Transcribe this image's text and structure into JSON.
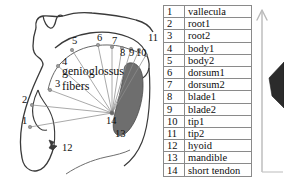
{
  "figure": {
    "title": "",
    "diagram_labels": {
      "fiber_text_line1": "genioglossus",
      "fiber_text_line2": "fibers"
    },
    "diagram_numbers": [
      {
        "id": "1",
        "x": 22,
        "y": 120
      },
      {
        "id": "2",
        "x": 22,
        "y": 100
      },
      {
        "id": "3",
        "x": 57,
        "y": 84
      },
      {
        "id": "4",
        "x": 62,
        "y": 63
      },
      {
        "id": "5",
        "x": 74,
        "y": 45
      },
      {
        "id": "6",
        "x": 100,
        "y": 42
      },
      {
        "id": "7",
        "x": 114,
        "y": 45
      },
      {
        "id": "8",
        "x": 123,
        "y": 54
      },
      {
        "id": "9",
        "x": 132,
        "y": 53
      },
      {
        "id": "10",
        "x": 139,
        "y": 53
      },
      {
        "id": "11",
        "x": 150,
        "y": 40
      },
      {
        "id": "12",
        "x": 63,
        "y": 148
      },
      {
        "id": "13",
        "x": 118,
        "y": 134
      },
      {
        "id": "14",
        "x": 110,
        "y": 119
      }
    ]
  },
  "legend": {
    "columns": [
      "index",
      "name"
    ],
    "rows": [
      {
        "index": "1",
        "name": "vallecula"
      },
      {
        "index": "2",
        "name": "root1"
      },
      {
        "index": "3",
        "name": "root2"
      },
      {
        "index": "4",
        "name": "body1"
      },
      {
        "index": "5",
        "name": "body2"
      },
      {
        "index": "6",
        "name": "dorsum1"
      },
      {
        "index": "7",
        "name": "dorsum2"
      },
      {
        "index": "8",
        "name": "blade1"
      },
      {
        "index": "9",
        "name": "blade2"
      },
      {
        "index": "10",
        "name": "tip1"
      },
      {
        "index": "11",
        "name": "tip2"
      },
      {
        "index": "12",
        "name": "hyoid"
      },
      {
        "index": "13",
        "name": "mandible"
      },
      {
        "index": "14",
        "name": "short tendon"
      }
    ]
  },
  "annotation": {
    "arrow_name": "up-arrow",
    "arrow_label": ""
  },
  "colors": {
    "outline": "#3a3a3a",
    "fiber_line": "#8c8c8c",
    "node": "#9a9a9a",
    "tongue_fill": "#6e6e6e",
    "hyoid_fill": "#3c3c3c",
    "table_border": "#8a8a8a",
    "text": "#0d0d0d",
    "arrow": "#b9b9b9",
    "dark_shape": "#2b2b2b"
  }
}
